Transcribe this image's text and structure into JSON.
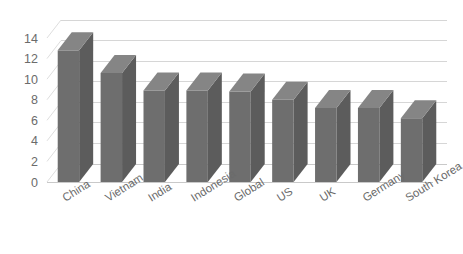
{
  "chart_data": {
    "type": "bar",
    "title": "",
    "subtitle": "",
    "xlabel": "",
    "ylabel": "",
    "categories": [
      "China",
      "Vietnam",
      "India",
      "Indonesia",
      "Global",
      "US",
      "UK",
      "Germany",
      "South Korea"
    ],
    "values": [
      12.8,
      10.6,
      8.9,
      8.9,
      8.8,
      8.0,
      7.2,
      7.2,
      6.2
    ],
    "ylim": [
      0,
      14
    ],
    "y_ticks": [
      "0",
      "2",
      "4",
      "6",
      "8",
      "10",
      "12",
      "14"
    ],
    "y_tick_values": [
      0,
      2,
      4,
      6,
      8,
      10,
      12,
      14
    ],
    "y_tick_step": 2,
    "grid": true,
    "grid_axis": "y",
    "legend": false,
    "legend_position": "none",
    "style": "3d-column",
    "colors": {
      "bar_front": "#6e6e6e",
      "bar_side": "#5c5c5c",
      "bar_top": "#858585",
      "gridline": "#d6d6d6",
      "axis_text": "#6b6b6b",
      "background": "#ffffff"
    }
  }
}
